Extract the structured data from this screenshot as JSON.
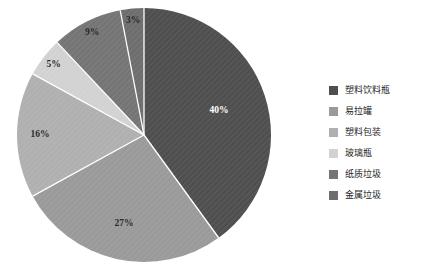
{
  "chart_data": {
    "type": "pie",
    "title": "",
    "subtitle": "",
    "xlabel": "",
    "ylabel": "",
    "grid": false,
    "legend_position": "right",
    "background_color": "#FFFFFF",
    "start_angle_deg": 0,
    "direction": "clockwise",
    "slice_separator_color": "#FFFFFF",
    "hatch_pattern": "diagonal-lines",
    "categories": [
      "塑料饮料瓶",
      "易拉罐",
      "塑料包装",
      "玻璃瓶",
      "纸质垃圾",
      "金属垃圾"
    ],
    "values": [
      40,
      27,
      16,
      5,
      9,
      3
    ],
    "data_labels": [
      "40%",
      "27%",
      "16%",
      "5%",
      "9%",
      "3%"
    ],
    "colors": [
      "#4F4F4F",
      "#9A9A9A",
      "#B0B0B0",
      "#D2D2D2",
      "#757575",
      "#6E6E6E"
    ],
    "label_text_colors": [
      "#FFFFFF",
      "#2B2B2B",
      "#2B2B2B",
      "#2B2B2B",
      "#2B2B2B",
      "#2B2B2B"
    ],
    "slices": [
      {
        "label": "塑料饮料瓶",
        "value": 40,
        "data_label": "40%",
        "color": "#4F4F4F",
        "label_on_dark": true
      },
      {
        "label": "易拉罐",
        "value": 27,
        "data_label": "27%",
        "color": "#9A9A9A",
        "label_on_dark": false
      },
      {
        "label": "塑料包装",
        "value": 16,
        "data_label": "16%",
        "color": "#B0B0B0",
        "label_on_dark": false
      },
      {
        "label": "玻璃瓶",
        "value": 5,
        "data_label": "5%",
        "color": "#D2D2D2",
        "label_on_dark": false
      },
      {
        "label": "纸质垃圾",
        "value": 9,
        "data_label": "9%",
        "color": "#757575",
        "label_on_dark": false
      },
      {
        "label": "金属垃圾",
        "value": 3,
        "data_label": "3%",
        "color": "#6E6E6E",
        "label_on_dark": false
      }
    ]
  },
  "legend": {
    "items": [
      {
        "label": "塑料饮料瓶",
        "color": "#4F4F4F"
      },
      {
        "label": "易拉罐",
        "color": "#9A9A9A"
      },
      {
        "label": "塑料包装",
        "color": "#B0B0B0"
      },
      {
        "label": "玻璃瓶",
        "color": "#D2D2D2"
      },
      {
        "label": "纸质垃圾",
        "color": "#757575"
      },
      {
        "label": "金属垃圾",
        "color": "#6E6E6E"
      }
    ]
  },
  "geometry": {
    "center_x": 144,
    "center_y": 135,
    "radius": 127
  }
}
